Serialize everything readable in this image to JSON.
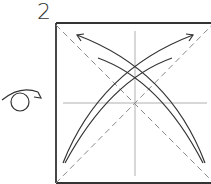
{
  "diagram": {
    "type": "origami-step",
    "step_number": "2",
    "elements": [
      {
        "kind": "square-paper",
        "description": "square sheet outline"
      },
      {
        "kind": "crease",
        "style": "thin-gray",
        "description": "vertical and horizontal center creases"
      },
      {
        "kind": "valley-fold-line",
        "style": "dashed",
        "description": "both diagonals"
      },
      {
        "kind": "fold-and-unfold-arrow",
        "description": "curved double-headed arrow bottom-left to top-right"
      },
      {
        "kind": "fold-and-unfold-arrow",
        "description": "curved double-headed arrow bottom-right to top-left"
      },
      {
        "kind": "turn-over-symbol",
        "description": "loop arrow indicating turn paper over"
      }
    ],
    "colors": {
      "outline": "#333333",
      "crease": "#b0b0b0",
      "dashed": "#888888",
      "arrow": "#333333"
    }
  }
}
